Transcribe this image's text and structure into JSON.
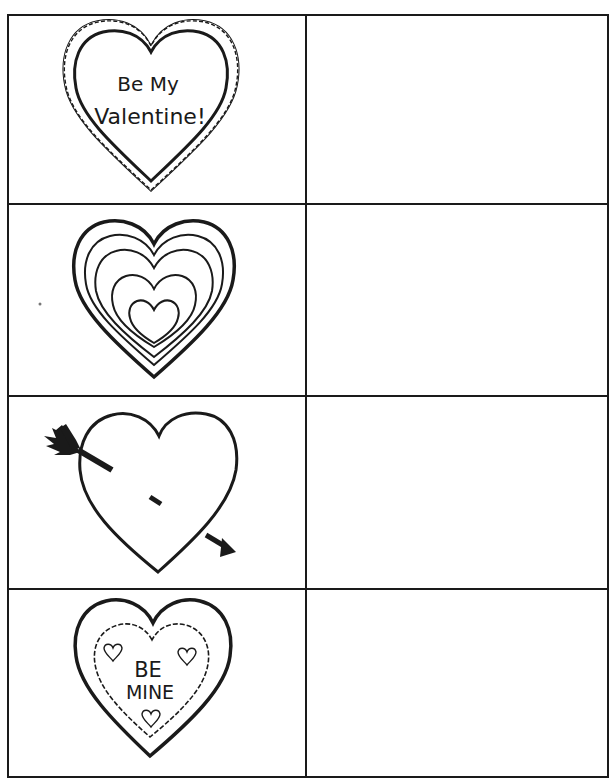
{
  "worksheet": {
    "layout": {
      "rows": 4,
      "columns": 2
    },
    "rows": [
      {
        "index": 1,
        "picture": "scalloped-heart-with-text",
        "heart_text_line1": "Be My",
        "heart_text_line2": "Valentine!",
        "answer_cell": ""
      },
      {
        "index": 2,
        "picture": "concentric-hearts",
        "ring_count": 5,
        "answer_cell": ""
      },
      {
        "index": 3,
        "picture": "heart-with-arrow",
        "answer_cell": ""
      },
      {
        "index": 4,
        "picture": "be-mine-heart",
        "heart_text_line1": "BE",
        "heart_text_line2": "MINE",
        "small_hearts": 3,
        "answer_cell": ""
      }
    ],
    "colors": {
      "ink": "#1a1a1a",
      "paper": "#ffffff"
    }
  }
}
